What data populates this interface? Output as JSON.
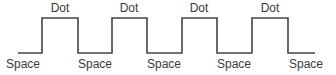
{
  "diagram": {
    "type": "square-wave",
    "line_color": "#444444",
    "levels": {
      "high_y": 18,
      "low_y": 53
    },
    "waveform_points": [
      [
        18,
        53
      ],
      [
        42,
        53
      ],
      [
        42,
        18
      ],
      [
        78,
        18
      ],
      [
        78,
        53
      ],
      [
        112,
        53
      ],
      [
        112,
        18
      ],
      [
        147,
        18
      ],
      [
        147,
        53
      ],
      [
        182,
        53
      ],
      [
        182,
        18
      ],
      [
        217,
        18
      ],
      [
        217,
        53
      ],
      [
        252,
        53
      ],
      [
        252,
        18
      ],
      [
        288,
        18
      ],
      [
        288,
        53
      ],
      [
        315,
        53
      ]
    ],
    "dot_labels": [
      {
        "text": "Dot",
        "x": 60
      },
      {
        "text": "Dot",
        "x": 129
      },
      {
        "text": "Dot",
        "x": 199
      },
      {
        "text": "Dot",
        "x": 270
      }
    ],
    "space_labels": [
      {
        "text": "Space",
        "x": 23
      },
      {
        "text": "Space",
        "x": 95
      },
      {
        "text": "Space",
        "x": 164
      },
      {
        "text": "Space",
        "x": 234
      },
      {
        "text": "Space",
        "x": 306
      }
    ]
  }
}
